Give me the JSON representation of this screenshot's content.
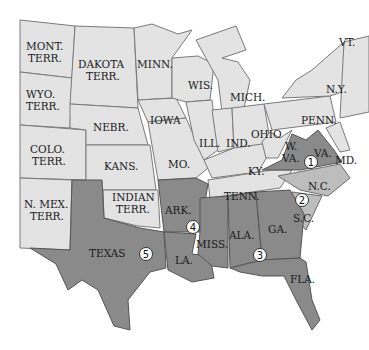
{
  "map": {
    "colors": {
      "union": "#e3e3e3",
      "second_wave": "#bdbdbd",
      "confederate": "#8a8a8a",
      "border": "#6d6d6d",
      "background": "#ffffff"
    },
    "labels": {
      "mont": [
        "MONT.",
        "TERR."
      ],
      "dakota": [
        "DAKOTA",
        "TERR."
      ],
      "minn": "MINN.",
      "wis": "WIS.",
      "mich": "MICH.",
      "vt": "VT.",
      "ny": "N.Y.",
      "wyo": [
        "WYO.",
        "TERR."
      ],
      "nebr": "NEBR.",
      "iowa": "IOWA",
      "ill": "ILL.",
      "ind": "IND.",
      "ohio": "OHIO",
      "penn": "PENN.",
      "colo": [
        "COLO.",
        "TERR."
      ],
      "kans": "KANS.",
      "mo": "MO.",
      "wva": [
        "W.",
        "VA."
      ],
      "va": "VA.",
      "md": "MD.",
      "ky": "KY.",
      "nmex": [
        "N. MEX.",
        "TERR."
      ],
      "indian": [
        "INDIAN",
        "TERR."
      ],
      "tenn": "TENN.",
      "nc": "N.C.",
      "ark": "ARK.",
      "sc": "S.C.",
      "ga": "GA.",
      "ala": "ALA.",
      "miss": "MISS.",
      "la": "LA.",
      "texas": "TEXAS",
      "fla": "FLA."
    },
    "markers": [
      {
        "num": "1",
        "region": "VA."
      },
      {
        "num": "2",
        "region": "N.C./S.C."
      },
      {
        "num": "3",
        "region": "ALA./GA."
      },
      {
        "num": "4",
        "region": "ARK."
      },
      {
        "num": "5",
        "region": "TEXAS"
      }
    ]
  }
}
